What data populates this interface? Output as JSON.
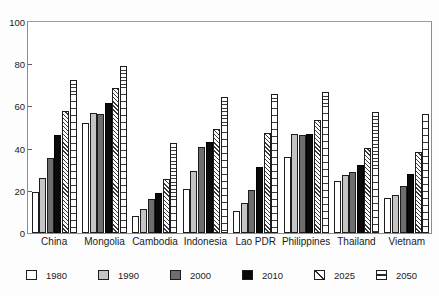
{
  "chart_data": {
    "type": "bar",
    "title": "",
    "xlabel": "",
    "ylabel": "",
    "ylim": [
      0,
      100
    ],
    "yticks": [
      0,
      20,
      40,
      60,
      80,
      100
    ],
    "ytick_labels": [
      "0",
      "20",
      "40",
      "60",
      "80",
      "100"
    ],
    "grid": false,
    "legend_position": "bottom",
    "categories": [
      "China",
      "Mongolia",
      "Cambodia",
      "Indonesia",
      "Lao PDR",
      "Philippines",
      "Thailand",
      "Vietnam"
    ],
    "series": [
      {
        "name": "1980",
        "color": "#ffffff",
        "pattern": "solid",
        "values": [
          19.5,
          52.0,
          8.0,
          21.0,
          10.5,
          36.0,
          24.5,
          16.5
        ]
      },
      {
        "name": "1990",
        "color": "#c4c4c4",
        "pattern": "solid",
        "values": [
          26.0,
          57.0,
          11.5,
          29.5,
          14.0,
          47.0,
          27.5,
          18.0
        ]
      },
      {
        "name": "2000",
        "color": "#6e6e6e",
        "pattern": "solid",
        "values": [
          35.5,
          56.5,
          16.0,
          41.0,
          20.5,
          46.5,
          29.0,
          22.5
        ]
      },
      {
        "name": "2010",
        "color": "#0a0a0a",
        "pattern": "solid",
        "values": [
          46.5,
          61.5,
          19.0,
          43.0,
          31.5,
          47.0,
          32.0,
          28.0
        ]
      },
      {
        "name": "2025",
        "color": "#ffffff",
        "pattern": "diagonal-hatch",
        "values": [
          58.0,
          68.5,
          25.5,
          49.5,
          47.5,
          53.5,
          40.5,
          38.5
        ]
      },
      {
        "name": "2050",
        "color": "#ffffff",
        "pattern": "horizontal-hatch",
        "values": [
          72.5,
          79.0,
          42.5,
          64.5,
          66.0,
          67.0,
          57.5,
          56.5
        ]
      }
    ]
  },
  "axis": {
    "y_labels": [
      "100",
      "80",
      "60",
      "40",
      "20",
      "0"
    ]
  },
  "x_labels": [
    "China",
    "Mongolia",
    "Cambodia",
    "Indonesia",
    "Lao PDR",
    "Philippines",
    "Thailand",
    "Vietnam"
  ],
  "legend": {
    "items": [
      {
        "label": "1980"
      },
      {
        "label": "1990"
      },
      {
        "label": "2000"
      },
      {
        "label": "2010"
      },
      {
        "label": "2025"
      },
      {
        "label": "2050"
      }
    ]
  }
}
